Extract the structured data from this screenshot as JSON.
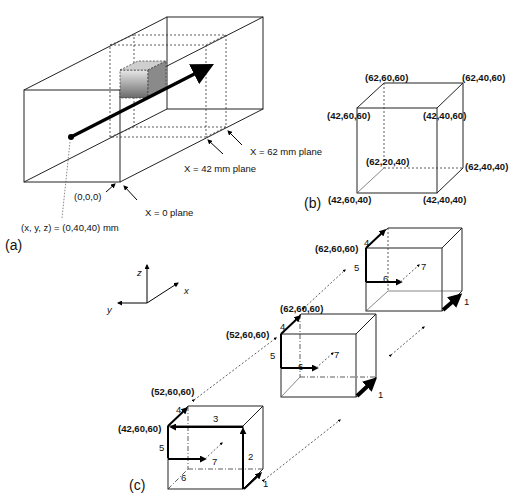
{
  "panel_a": {
    "label": "(a)",
    "origin_label": "(0,0,0)",
    "start_point_label": "(x, y, z) = (0,40,40) mm",
    "plane_x0": "X = 0 plane",
    "plane_x42": "X = 42 mm plane",
    "plane_x62": "X = 62 mm plane"
  },
  "panel_b": {
    "label": "(b)",
    "corners": {
      "back_top_left": "(62,60,60)",
      "back_top_right": "(62,40,60)",
      "front_top_left": "(42,60,60)",
      "front_top_right": "(42,40,60)",
      "back_bottom_left": "(62,20,40)",
      "back_bottom_right": "(62,40,40)",
      "front_bottom_left": "(42,60,40)",
      "front_bottom_right": "(42,40,40)"
    }
  },
  "axes": {
    "z": "z",
    "x": "x",
    "y": "y"
  },
  "panel_c": {
    "label": "(c)",
    "cube1": {
      "corner_front": "(42,60,60)",
      "corner_back": "(52,60,60)",
      "steps": [
        "1",
        "2",
        "3",
        "4",
        "5",
        "6",
        "7"
      ]
    },
    "cube2": {
      "corner_front": "(52,60,60)",
      "corner_back": "(62,60,60)",
      "steps": [
        "1",
        "4",
        "5",
        "6",
        "7"
      ]
    },
    "cube3": {
      "corner_back": "(62,60,60)",
      "steps": [
        "1",
        "4",
        "5",
        "6",
        "7"
      ]
    }
  }
}
